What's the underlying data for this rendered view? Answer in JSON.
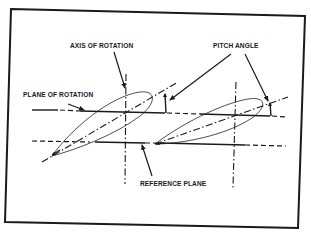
{
  "diagram": {
    "type": "propeller blade pitch diagram",
    "labels": {
      "axis_of_rotation": "AXIS OF ROTATION",
      "pitch_angle": "PITCH ANGLE",
      "plane_of_rotation": "PLANE OF ROTATION",
      "reference_plane": "REFERENCE PLANE"
    },
    "elements": [
      {
        "name": "left-airfoil",
        "kind": "blade section"
      },
      {
        "name": "right-airfoil",
        "kind": "blade section"
      },
      {
        "name": "left-axis-of-rotation",
        "kind": "dash-dot vertical line"
      },
      {
        "name": "right-axis-of-rotation",
        "kind": "dash-dot vertical line"
      },
      {
        "name": "plane-of-rotation-line",
        "kind": "long-dash horizontal line"
      },
      {
        "name": "reference-plane-line",
        "kind": "long-dash horizontal line"
      },
      {
        "name": "left-chord-line",
        "kind": "dash-dot inclined line"
      },
      {
        "name": "right-chord-line",
        "kind": "dash-dot inclined line"
      },
      {
        "name": "left-pitch-angle-marker",
        "kind": "angle indicator"
      },
      {
        "name": "right-pitch-angle-marker",
        "kind": "angle indicator"
      }
    ],
    "colors": {
      "ink": "#1a1a1a",
      "paper": "#ffffff"
    }
  }
}
